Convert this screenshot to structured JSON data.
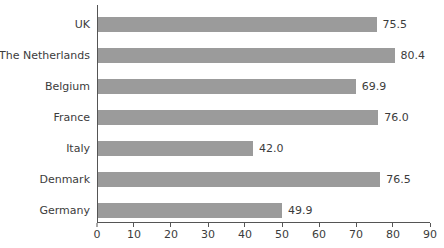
{
  "chart_data": {
    "type": "bar",
    "orientation": "horizontal",
    "title": "",
    "xlabel": "",
    "ylabel": "",
    "categories": [
      "UK",
      "The Netherlands",
      "Belgium",
      "France",
      "Italy",
      "Denmark",
      "Germany"
    ],
    "values": [
      75.5,
      80.4,
      69.9,
      76.0,
      42.0,
      76.5,
      49.9
    ],
    "value_labels": [
      "75.5",
      "80.4",
      "69.9",
      "76.0",
      "42.0",
      "76.5",
      "49.9"
    ],
    "xlim": [
      0,
      90
    ],
    "xticks": [
      "0",
      "10",
      "20",
      "30",
      "40",
      "50",
      "60",
      "70",
      "80",
      "90"
    ],
    "grid": false,
    "legend": "none",
    "colors": {
      "bar": "#9b9b9b",
      "text": "#3c3c3c",
      "axis": "#555555",
      "background": "#ffffff"
    }
  }
}
